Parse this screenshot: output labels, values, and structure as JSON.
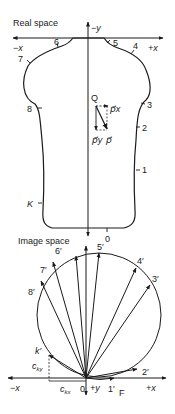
{
  "real_space": {
    "title": "Real space",
    "axis_labels": {
      "neg_y": "−y",
      "neg_x": "−x",
      "pos_x": "+x"
    },
    "contour_points": [
      "1",
      "2",
      "3",
      "4",
      "5",
      "6",
      "7",
      "8",
      "K"
    ],
    "point_labels": {
      "p1": "1",
      "p2": "2",
      "p3": "3",
      "p4": "4",
      "p5": "5",
      "p6": "6",
      "p7": "7",
      "p8": "8",
      "k": "K"
    },
    "vector_labels": {
      "q": "Q",
      "px": "p⃗x",
      "py": "p⃗y",
      "p": "p⃗"
    },
    "bottom_point": "0"
  },
  "image_space": {
    "title": "Image space",
    "axis_labels": {
      "neg_x": "−x",
      "pos_x": "+x",
      "pos_y": "+y",
      "origin": "0"
    },
    "point_labels": {
      "p1": "1′",
      "p2": "2′",
      "p3": "3′",
      "p4": "4′",
      "p5": "5′",
      "p6": "6′",
      "p7": "7′",
      "p8": "8′",
      "k": "k′",
      "f": "F"
    },
    "component_labels": {
      "cky": "c",
      "cky_sub": "ky",
      "ckx": "c",
      "ckx_sub": "kx"
    }
  }
}
